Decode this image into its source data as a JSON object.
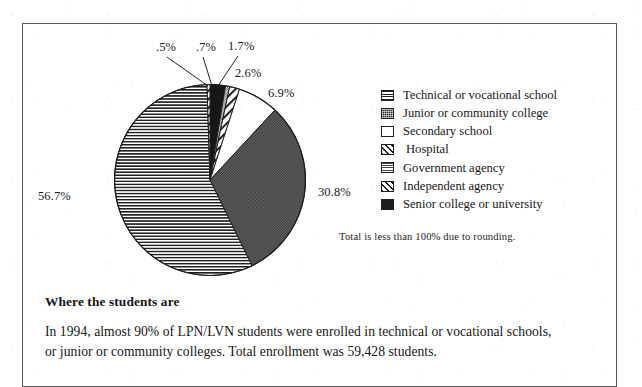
{
  "figure": {
    "note": "Total is less than 100% due to rounding."
  },
  "chart_data": {
    "type": "pie",
    "title": "",
    "legend_position": "right",
    "note": "Total is less than 100% due to rounding.",
    "total_label": "59,428 students",
    "categories": [
      "Technical or vocational school",
      "Junior or community college",
      "Secondary school",
      "Hospital",
      "Government agency",
      "Independent agency",
      "Senior college or university"
    ],
    "values": [
      56.7,
      30.8,
      6.9,
      0.5,
      0.7,
      1.7,
      2.6
    ],
    "value_labels": [
      ".5%",
      ".7%",
      "1.7%",
      "2.6%",
      "6.9%",
      "30.8%",
      "56.7%"
    ],
    "slices": [
      {
        "label": "Technical or vocational school",
        "value": 56.7,
        "value_label": "56.7%",
        "pattern": "horizontal-lines"
      },
      {
        "label": "Junior or community college",
        "value": 30.8,
        "value_label": "30.8%",
        "pattern": "dark-check"
      },
      {
        "label": "Secondary school",
        "value": 6.9,
        "value_label": "6.9%",
        "pattern": "white"
      },
      {
        "label": "Hospital",
        "value": 0.5,
        "value_label": ".5%",
        "pattern": "diagonal-hatch"
      },
      {
        "label": "Government agency",
        "value": 0.7,
        "value_label": ".7%",
        "pattern": "grey-check"
      },
      {
        "label": "Independent agency",
        "value": 1.7,
        "value_label": "1.7%",
        "pattern": "diagonal-hatch"
      },
      {
        "label": "Senior college or university",
        "value": 2.6,
        "value_label": "2.6%",
        "pattern": "solid-black"
      }
    ]
  },
  "legend": {
    "items": [
      {
        "label": "Technical or vocational school",
        "swatch": "horizontal-lines-swatch"
      },
      {
        "label": "Junior or community college",
        "swatch": "dark-check-swatch"
      },
      {
        "label": "Secondary school",
        "swatch": "white-swatch"
      },
      {
        "label": "Hospital",
        "swatch": "diagonal-hatch-swatch"
      },
      {
        "label": "Government agency",
        "swatch": "grey-check-swatch"
      },
      {
        "label": "Independent agency",
        "swatch": "diagonal-hatch-swatch"
      },
      {
        "label": "Senior college or university",
        "swatch": "solid-black-swatch"
      }
    ]
  },
  "labels": {
    "hospital_pct": ".5%",
    "government_pct": ".7%",
    "independent_pct": "1.7%",
    "senior_pct": "2.6%",
    "secondary_pct": "6.9%",
    "junior_pct": "30.8%",
    "technical_pct": "56.7%"
  },
  "caption": {
    "title": "Where the students are",
    "line1": "In 1994, almost 90% of LPN/LVN students were enrolled in technical or vocational schools,",
    "line2": "or junior or community colleges. Total enrollment was 59,428 students."
  }
}
